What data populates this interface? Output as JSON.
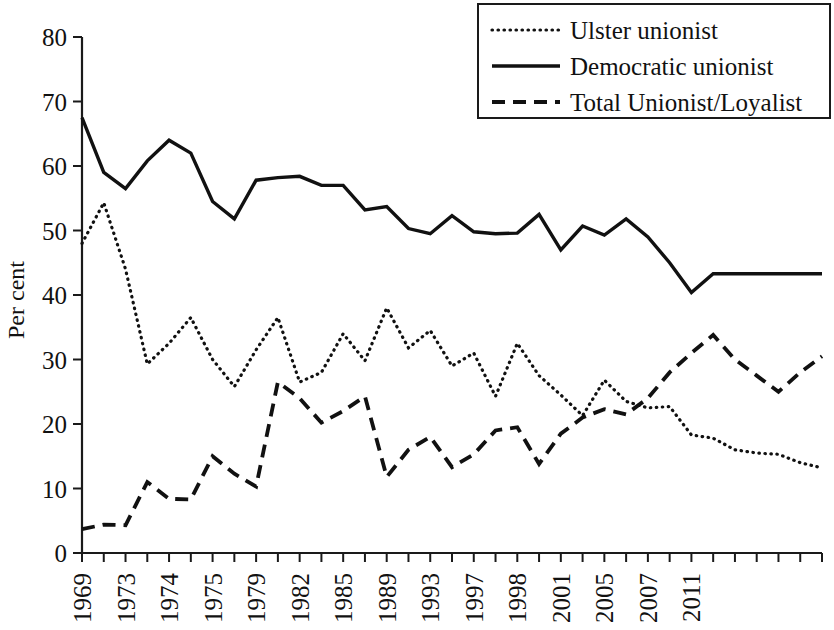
{
  "chart_data": {
    "type": "line",
    "title": "",
    "xlabel": "",
    "ylabel": "Per cent",
    "ylim": [
      0,
      80
    ],
    "ytick_step": 10,
    "yticks": [
      "0",
      "10",
      "20",
      "30",
      "40",
      "50",
      "60",
      "70",
      "80"
    ],
    "grid": false,
    "legend_position": "top-right",
    "x": [
      "1969",
      "1970",
      "1973F",
      "1973A",
      "1974F",
      "1974O",
      "1975",
      "1977",
      "1979",
      "1979E",
      "1981",
      "1982",
      "1983",
      "1984",
      "1985",
      "1987",
      "1989",
      "1992",
      "1993",
      "1994",
      "1996",
      "1997",
      "1997L",
      "1998",
      "1999",
      "2001",
      "2001L",
      "2003",
      "2004",
      "2005",
      "2005L",
      "2007",
      "2009",
      "2010",
      "2011"
    ],
    "x_tick_labels": [
      "1969",
      "",
      "1973",
      "",
      "1974",
      "",
      "1975",
      "",
      "1979",
      "",
      "1982",
      "",
      "1985",
      "",
      "1989",
      "",
      "1993",
      "",
      "1997",
      "",
      "1998",
      "",
      "2001",
      "",
      "2005",
      "",
      "2007",
      "",
      "2011"
    ],
    "x_labels_visible": [
      "1969",
      "1973",
      "1974",
      "1975",
      "1979",
      "1982",
      "1985",
      "1989",
      "1993",
      "1997",
      "1998",
      "2001",
      "2005",
      "2007",
      "2011"
    ],
    "series": [
      {
        "name": "Ulster unionist",
        "style": "dotted",
        "values": [
          48.0,
          54.3,
          44.0,
          29.3,
          32.5,
          36.5,
          30.0,
          25.8,
          31.5,
          36.5,
          26.5,
          28.0,
          34.0,
          29.8,
          38.0,
          31.8,
          34.5,
          29.0,
          31.0,
          24.3,
          32.5,
          27.5,
          24.5,
          21.3,
          26.8,
          23.5,
          22.5,
          22.7,
          18.3,
          17.8,
          16.0,
          15.5,
          15.3,
          14.0,
          13.2
        ]
      },
      {
        "name": "Democratic unionist",
        "style": "solid",
        "values": [
          67.5,
          59.0,
          56.5,
          60.8,
          64.0,
          62.0,
          54.5,
          51.8,
          57.8,
          58.2,
          58.4,
          57.0,
          57.0,
          53.2,
          53.7,
          50.3,
          49.5,
          52.3,
          49.8,
          49.5,
          49.6,
          52.5,
          47.0,
          50.7,
          49.3,
          51.8,
          49.0,
          45.0,
          40.4,
          43.3,
          43.3,
          43.3,
          43.3,
          43.3,
          43.3
        ]
      },
      {
        "name": "Total Unionist/Loyalist",
        "style": "dashed",
        "values": [
          3.7,
          4.4,
          4.3,
          11.0,
          8.4,
          8.3,
          15.0,
          12.3,
          10.3,
          26.5,
          24.0,
          20.2,
          22.0,
          24.3,
          11.8,
          16.0,
          18.0,
          13.3,
          15.3,
          19.0,
          19.5,
          13.8,
          18.5,
          21.0,
          22.3,
          21.5,
          24.0,
          28.0,
          31.0,
          33.8,
          30.0,
          27.5,
          25.0,
          28.0,
          30.5
        ]
      }
    ]
  },
  "axes": {
    "y_axis_title": "Per cent"
  },
  "legend": {
    "entries": [
      {
        "label": "Ulster unionist",
        "style": "dotted"
      },
      {
        "label": "Democratic unionist",
        "style": "solid"
      },
      {
        "label": "Total Unionist/Loyalist",
        "style": "dashed"
      }
    ]
  }
}
